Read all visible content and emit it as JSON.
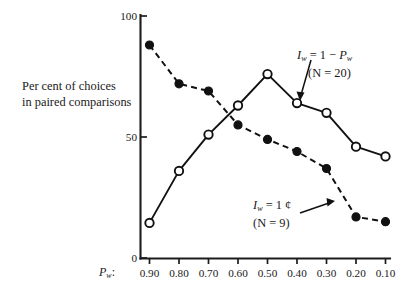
{
  "chart_data": {
    "type": "line",
    "title": "",
    "xlabel": "P_w:",
    "xlabel_display": "P",
    "xlabel_sub": "w",
    "xlabel_suffix": ":",
    "ylabel_line1": "Per cent of choices",
    "ylabel_line2": "in paired comparisons",
    "x": [
      0.9,
      0.8,
      0.7,
      0.6,
      0.5,
      0.4,
      0.3,
      0.2,
      0.1
    ],
    "categories": [
      "0.90",
      "0.80",
      "0.70",
      "0.60",
      "0.50",
      "0.40",
      "0.30",
      "0.20",
      "0.10"
    ],
    "xlim": [
      0.95,
      0.05
    ],
    "ylim": [
      0,
      100
    ],
    "yticks": [
      0,
      50,
      100
    ],
    "ytick_labels": [
      "0",
      "50",
      "100"
    ],
    "grid": false,
    "legend_position": "inline-annotations",
    "series": [
      {
        "name": "I_w = 1 - P_w (N = 20)",
        "marker": "open-circle",
        "line_style": "solid",
        "color": "#111111",
        "values": [
          14.5,
          36,
          51,
          63,
          76,
          64,
          60,
          46,
          42
        ]
      },
      {
        "name": "I_w = 1 cent (N = 9)",
        "marker": "filled-circle",
        "line_style": "dashed",
        "color": "#111111",
        "values": [
          88,
          72,
          69,
          55,
          49,
          44,
          37,
          17,
          15
        ]
      }
    ],
    "annotations": [
      {
        "id": "annotation-upper",
        "line1_var": "I",
        "line1_sub": "w",
        "line1_rest": " = 1 − ",
        "line1_var2": "P",
        "line1_sub2": "w",
        "line2": "(N = 20)",
        "points_to_series": 0,
        "points_to_index": 5
      },
      {
        "id": "annotation-lower",
        "line1_var": "I",
        "line1_sub": "w",
        "line1_rest": " = 1 ¢",
        "line2": "(N = 9)",
        "points_to_series": 1,
        "points_to_index": 7
      }
    ]
  }
}
